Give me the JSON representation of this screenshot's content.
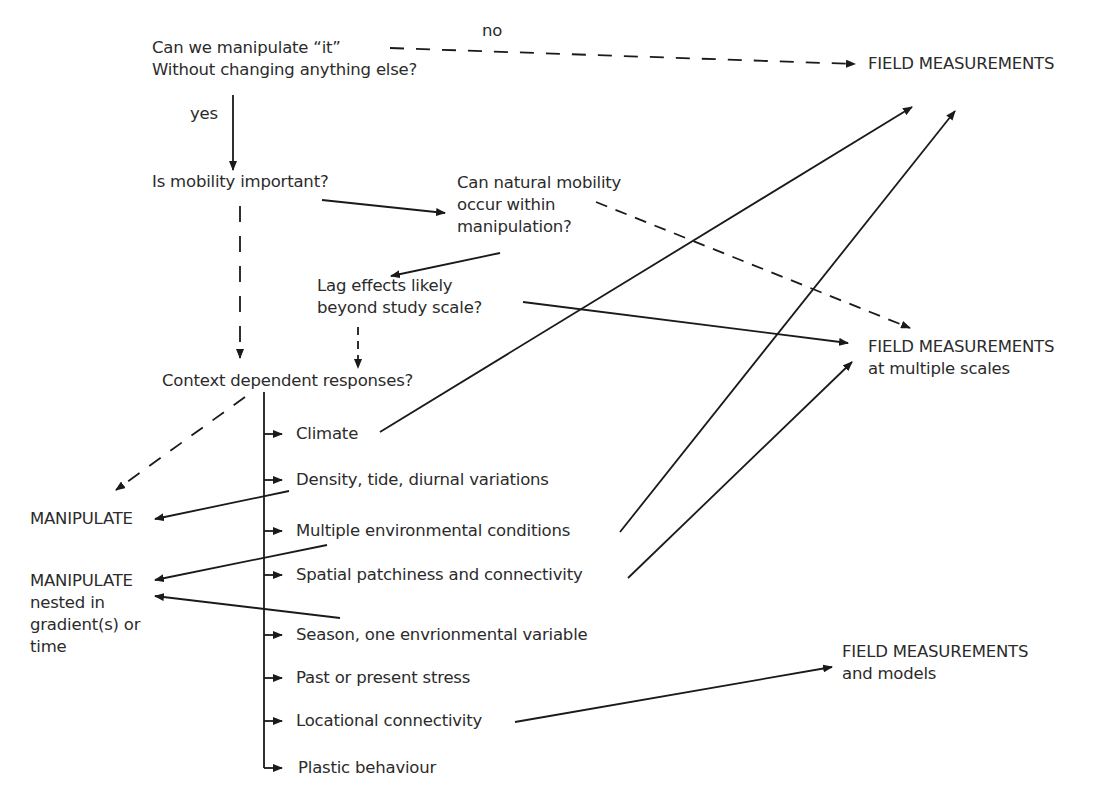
{
  "nodes": {
    "q_manipulate": {
      "line1": "Can we manipulate “it”",
      "line2": "Without changing anything else?"
    },
    "edge_no": "no",
    "edge_yes": "yes",
    "field_measurements": "FIELD MEASUREMENTS",
    "q_mobility": "Is mobility important?",
    "q_natural_mobility": {
      "line1": "Can natural mobility",
      "line2": "occur within",
      "line3": "manipulation?"
    },
    "q_lag": {
      "line1": "Lag effects likely",
      "line2": "beyond study scale?"
    },
    "field_multiple_scales": {
      "line1": "FIELD MEASUREMENTS",
      "line2": "at multiple scales"
    },
    "q_context": "Context dependent responses?",
    "manipulate": "MANIPULATE",
    "manipulate_nested": {
      "line1": "MANIPULATE",
      "line2": "nested in",
      "line3": "gradient(s) or",
      "line4": "time"
    },
    "field_models": {
      "line1": "FIELD MEASUREMENTS",
      "line2": "and models"
    }
  },
  "context_factors": [
    "Climate",
    "Density, tide, diurnal variations",
    "Multiple environmental conditions",
    "Spatial patchiness and connectivity",
    "Season, one envrionmental variable",
    "Past or present stress",
    "Locational connectivity",
    "Plastic behaviour"
  ],
  "edges": [
    {
      "from": "q_manipulate",
      "to": "field_measurements",
      "label": "no",
      "style": "dashed"
    },
    {
      "from": "q_manipulate",
      "to": "q_mobility",
      "label": "yes",
      "style": "solid"
    },
    {
      "from": "q_mobility",
      "to": "q_natural_mobility",
      "style": "solid"
    },
    {
      "from": "q_mobility",
      "to": "q_context",
      "style": "dashed"
    },
    {
      "from": "q_natural_mobility",
      "to": "q_lag",
      "style": "solid"
    },
    {
      "from": "q_natural_mobility",
      "to": "field_multiple_scales",
      "style": "dashed"
    },
    {
      "from": "q_lag",
      "to": "field_multiple_scales",
      "style": "solid"
    },
    {
      "from": "q_lag",
      "to": "q_context",
      "style": "dashed"
    },
    {
      "from": "q_context",
      "to": "manipulate",
      "style": "dashed"
    },
    {
      "from": "Climate",
      "to": "field_measurements",
      "style": "solid"
    },
    {
      "from": "Density, tide, diurnal variations",
      "to": "manipulate",
      "style": "solid"
    },
    {
      "from": "Multiple environmental conditions",
      "to": "manipulate_nested",
      "style": "solid"
    },
    {
      "from": "Multiple environmental conditions",
      "to": "field_measurements",
      "style": "solid"
    },
    {
      "from": "Spatial patchiness and connectivity",
      "to": "field_multiple_scales",
      "style": "solid"
    },
    {
      "from": "Season, one envrionmental variable",
      "to": "manipulate_nested",
      "style": "solid"
    },
    {
      "from": "Locational connectivity",
      "to": "field_models",
      "style": "solid"
    }
  ],
  "colors": {
    "ink": "#2b2b2b",
    "background": "#ffffff"
  }
}
